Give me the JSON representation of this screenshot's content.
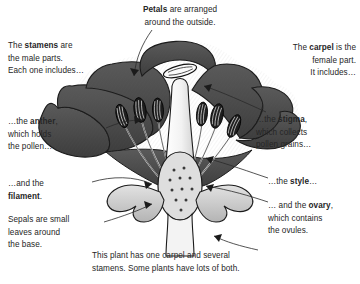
{
  "diagram": {
    "background_color": "#ffffff",
    "ink_color": "#262626",
    "petal_color": "#494949",
    "stamen_color": "#2b2b2b",
    "style_color": "#f7f7f7",
    "sepal_color": "#c9c9c9",
    "ovary_color": "#d8d8d8"
  },
  "annotations": {
    "petals": {
      "text": "Petals are arranged\naround the outside.",
      "bold_terms": [
        "Petals"
      ]
    },
    "stamens": {
      "text": "The stamens are\nthe male parts.\nEach one includes…",
      "bold_terms": [
        "stamens"
      ]
    },
    "anther": {
      "text": "…the anther,\nwhich holds\nthe pollen…",
      "bold_terms": [
        "anther"
      ]
    },
    "filament": {
      "text": "…and the\nfilament.",
      "bold_terms": [
        "filament"
      ]
    },
    "sepals": {
      "text": "Sepals are small\nleaves around\nthe base.",
      "bold_terms": []
    },
    "carpel": {
      "text": "The carpel is the\nfemale part.\nIt includes…",
      "bold_terms": [
        "carpel"
      ]
    },
    "stigma": {
      "text": "…the stigma,\nwhich collects\npollen grains…",
      "bold_terms": [
        "stigma"
      ]
    },
    "style": {
      "text": "…the style…",
      "bold_terms": [
        "style"
      ]
    },
    "ovary": {
      "text": "… and the ovary,\nwhich contains\nthe ovules.",
      "bold_terms": [
        "ovary"
      ]
    },
    "caption": {
      "text": "This plant has one carpel and several\nstamens. Some plants have lots of both.",
      "bold_terms": []
    }
  },
  "parts_labelled": [
    "petals",
    "stamens",
    "anther",
    "filament",
    "sepals",
    "carpel",
    "stigma",
    "style",
    "ovary",
    "ovules"
  ]
}
